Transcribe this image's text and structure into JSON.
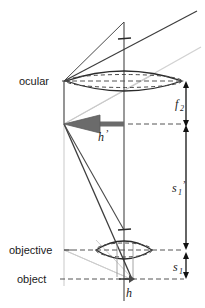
{
  "figure": {
    "kind": "optical-ray-diagram",
    "background_color": "#ffffff"
  },
  "colors": {
    "axis": "#6e6e6e",
    "ray_dark": "#3a3a3a",
    "ray_light": "#c9c9c9",
    "lens_outline": "#2b2b2b",
    "dashed": "#555555",
    "arrow_fill": "#6b6b6b",
    "arrow_edge": "#3a3a3a",
    "dimension": "#111111",
    "text": "#1a1a1a"
  },
  "labels": {
    "ocular": "ocular",
    "objective": "objective",
    "object": "object",
    "image_height": "h",
    "image_height_prime": "’",
    "object_height": "h",
    "focal_length": "f",
    "focal_length_sub": "2",
    "image_distance": "s",
    "image_distance_sub": "1",
    "image_distance_prime": "’",
    "object_distance": "s",
    "object_distance_sub": "1"
  },
  "elements": {
    "ocular_lens": {
      "name": "ocular",
      "center_x": 124,
      "center_y": 81,
      "half_width": 58,
      "half_height": 11
    },
    "objective_lens": {
      "name": "objective",
      "center_x": 124,
      "center_y": 250,
      "half_width": 29,
      "half_height": 11
    },
    "object_plane": {
      "name": "object",
      "y": 279
    },
    "image_plane": {
      "name": "intermediate image",
      "y": 124
    },
    "optical_axis": {
      "x": 124,
      "y_top": 22,
      "y_bottom": 300
    }
  },
  "dimensions": {
    "line_x": 186,
    "f2": {
      "label": "f",
      "sub": "2",
      "y_top": 84,
      "y_bottom": 124
    },
    "s1prime": {
      "label": "s",
      "sub": "1",
      "prime": "’",
      "y_top": 124,
      "y_bottom": 250
    },
    "s1": {
      "label": "s",
      "sub": "1",
      "y_top": 252,
      "y_bottom": 279
    }
  },
  "arrows": {
    "image_arrow": {
      "label": "h’",
      "tail_x": 124,
      "tip_x": 64,
      "y": 124,
      "direction": "left",
      "style": "thick-filled"
    },
    "object_arrow": {
      "label": "h",
      "tail_x": 124,
      "tip_x": 133,
      "y": 279,
      "direction": "right",
      "style": "thin-filled"
    }
  },
  "rays": [
    {
      "id": "ray-dark-upper",
      "color": "ray_dark",
      "from": [
        64,
        81
      ],
      "to": [
        196,
        12
      ]
    },
    {
      "id": "ray-light-upper",
      "color": "ray_light",
      "from": [
        64,
        124
      ],
      "to": [
        200,
        46
      ]
    },
    {
      "id": "ray-dark-object-to-image",
      "color": "ray_dark",
      "from": [
        64,
        124
      ],
      "to": [
        131,
        279
      ]
    },
    {
      "id": "ray-dark-object-to-objective",
      "color": "ray_dark",
      "from": [
        64,
        124
      ],
      "to": [
        124,
        229
      ]
    },
    {
      "id": "ray-light-left-vertical",
      "color": "ray_light",
      "from": [
        64,
        124
      ],
      "to": [
        64,
        285
      ]
    },
    {
      "id": "ray-light-objective-diag",
      "color": "ray_light",
      "from": [
        64,
        250
      ],
      "to": [
        133,
        279
      ]
    }
  ]
}
